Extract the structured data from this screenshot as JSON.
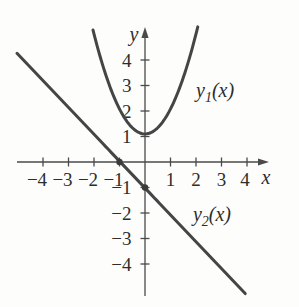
{
  "figure": {
    "width": 299,
    "height": 307,
    "background": "#fdfdfc"
  },
  "chart_data": {
    "type": "line",
    "title": "",
    "xlabel": "x",
    "ylabel": "y",
    "xlim": [
      -5.1,
      5.0
    ],
    "ylim": [
      -5.3,
      5.4
    ],
    "grid": false,
    "x_ticks": [
      {
        "v": -4,
        "label": "−4",
        "dx": -6
      },
      {
        "v": -3,
        "label": "−3",
        "dx": -6
      },
      {
        "v": -2,
        "label": "−2",
        "dx": -6
      },
      {
        "v": -1,
        "label": "−1",
        "dx": -6
      },
      {
        "v": 1,
        "label": "1",
        "dx": 0
      },
      {
        "v": 2,
        "label": "2",
        "dx": 0
      },
      {
        "v": 3,
        "label": "3",
        "dx": 0
      },
      {
        "v": 4,
        "label": "4",
        "dx": -2
      }
    ],
    "y_ticks": [
      {
        "v": 4,
        "label": "4"
      },
      {
        "v": 3,
        "label": "3"
      },
      {
        "v": 2,
        "label": "2"
      },
      {
        "v": 1,
        "label": "1"
      },
      {
        "v": -1,
        "label": "−1"
      },
      {
        "v": -2,
        "label": "−2"
      },
      {
        "v": -3,
        "label": "−3"
      },
      {
        "v": -4,
        "label": "−4"
      }
    ],
    "series": [
      {
        "name": "y1",
        "kind": "parabola",
        "label": {
          "main": "y",
          "sub": "1",
          "tail": "(x)"
        },
        "params": {
          "a": 0.98,
          "h": 0,
          "k": 1.1
        },
        "x_range": [
          -2.04,
          2.07
        ],
        "vertex": [
          0,
          1.1
        ],
        "label_anchor": [
          2.0,
          2.55
        ]
      },
      {
        "name": "y2",
        "kind": "linear",
        "label": {
          "main": "y",
          "sub": "2",
          "tail": "(x)"
        },
        "params": {
          "m": -1.053,
          "b": -1.02
        },
        "x_range": [
          -5.02,
          3.93
        ],
        "x_intercept": -1,
        "y_intercept": -1,
        "label_anchor": [
          1.88,
          -2.3
        ]
      }
    ],
    "markers": [
      {
        "x": -1,
        "y": 0
      },
      {
        "x": 0,
        "y": -1
      }
    ],
    "colors": {
      "axis": "#4a4a4a",
      "curve": "#454545",
      "text": "#2d2d2d",
      "marker": "#3a3a3a"
    },
    "layout": {
      "origin_px": [
        145,
        162
      ],
      "px_per_unit": 25.5,
      "x_axis_start_px": 17,
      "x_arrow_tip_px": 269,
      "y_axis_bottom_px": 296,
      "y_arrow_tip_px": 27,
      "tick_half_px": 4.5,
      "axis_width": 1.3,
      "curve_width": 3,
      "marker_radius": 3.2,
      "tick_font_size": 19,
      "x_tick_label_baseline_px": 185.5,
      "y_tick_label_right_px": 131.5,
      "axis_letter_font_size": 20,
      "xlabel_pos_px": [
        266,
        184
      ],
      "ylabel_pos_px": [
        134,
        41
      ],
      "annotation_font_size": 20,
      "annotation_sub_font_size": 14,
      "annotation_sub_dy": 5,
      "arrow_len_px": 11,
      "arrow_half_px": 3.6,
      "legend_position": "none"
    }
  }
}
